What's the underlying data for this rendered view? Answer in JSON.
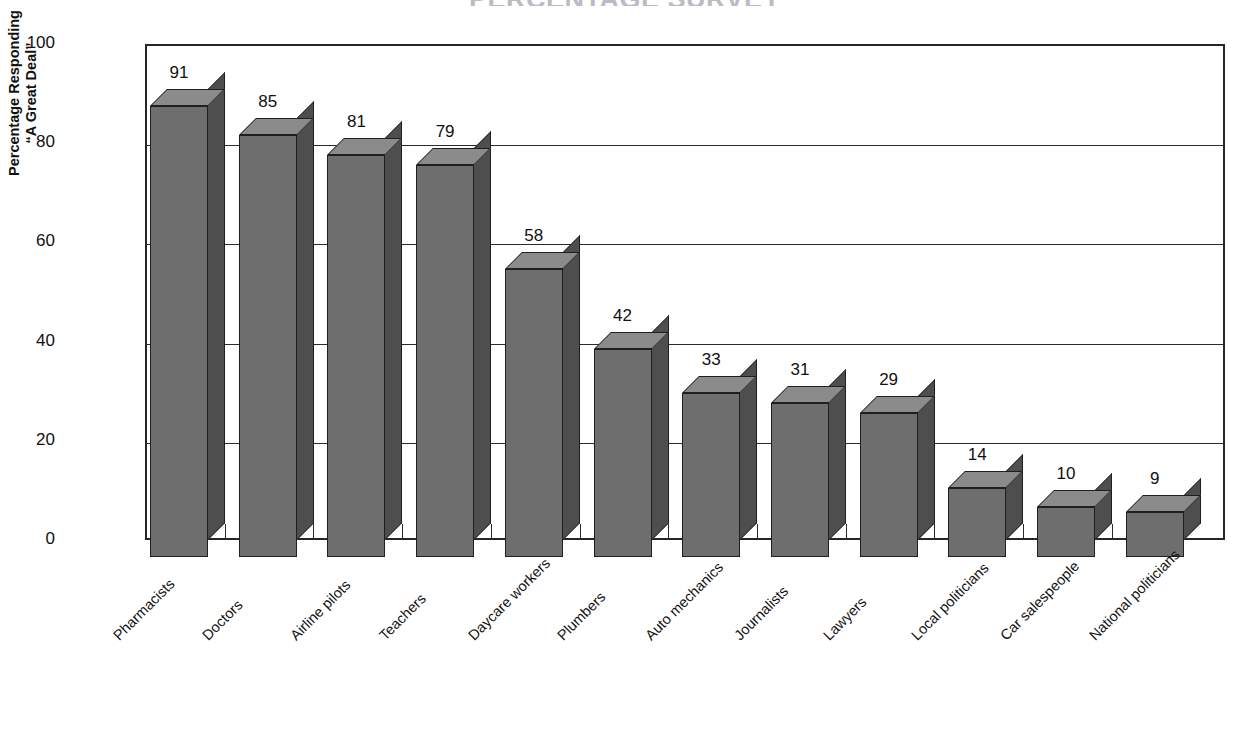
{
  "chart_title": "PERCENTAGE SURVEY",
  "axis": {
    "ylabel_line1": "Percentage Responding",
    "ylabel_line2": "“A Great Deal”",
    "yticks": [
      "0",
      "20",
      "40",
      "60",
      "80",
      "100"
    ]
  },
  "chart_data": {
    "type": "bar",
    "title": "PERCENTAGE SURVEY",
    "xlabel": "",
    "ylabel": "Percentage Responding “A Great Deal”",
    "ylim": [
      0,
      100
    ],
    "ytick_values": [
      0,
      20,
      40,
      60,
      80,
      100
    ],
    "grid": true,
    "legend": "none",
    "style": "3d-vertical-bars",
    "bar_color": "#6e6e6e",
    "bar_top_color": "#8b8b8b",
    "bar_side_color": "#4e4e4e",
    "categories": [
      "Pharmacists",
      "Doctors",
      "Airline pilots",
      "Teachers",
      "Daycare workers",
      "Plumbers",
      "Auto mechanics",
      "Journalists",
      "Lawyers",
      "Local politicians",
      "Car salespeople",
      "National politicians"
    ],
    "values": [
      91,
      85,
      81,
      79,
      58,
      42,
      33,
      31,
      29,
      14,
      10,
      9
    ],
    "data_labels": [
      "91",
      "85",
      "81",
      "79",
      "58",
      "42",
      "33",
      "31",
      "29",
      "14",
      "10",
      "9"
    ]
  }
}
